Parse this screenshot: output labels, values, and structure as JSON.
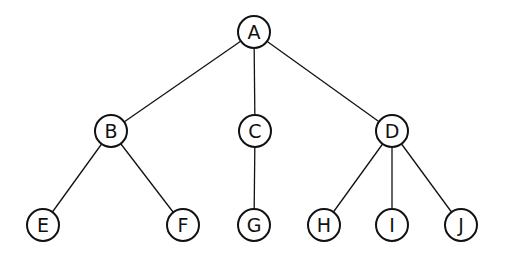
{
  "diagram": {
    "type": "tree",
    "colors": {
      "stroke": "#111111",
      "background": "#ffffff"
    },
    "nodes": [
      {
        "id": "A",
        "label": "A",
        "x": 254,
        "y": 32
      },
      {
        "id": "B",
        "label": "B",
        "x": 111,
        "y": 131
      },
      {
        "id": "C",
        "label": "C",
        "x": 255,
        "y": 131
      },
      {
        "id": "D",
        "label": "D",
        "x": 392,
        "y": 131
      },
      {
        "id": "E",
        "label": "E",
        "x": 43,
        "y": 225
      },
      {
        "id": "F",
        "label": "F",
        "x": 183,
        "y": 225
      },
      {
        "id": "G",
        "label": "G",
        "x": 254,
        "y": 225
      },
      {
        "id": "H",
        "label": "H",
        "x": 324,
        "y": 225
      },
      {
        "id": "I",
        "label": "I",
        "x": 392,
        "y": 225
      },
      {
        "id": "J",
        "label": "J",
        "x": 461,
        "y": 225
      }
    ],
    "edges": [
      [
        "A",
        "B"
      ],
      [
        "A",
        "C"
      ],
      [
        "A",
        "D"
      ],
      [
        "B",
        "E"
      ],
      [
        "B",
        "F"
      ],
      [
        "C",
        "G"
      ],
      [
        "D",
        "H"
      ],
      [
        "D",
        "I"
      ],
      [
        "D",
        "J"
      ]
    ]
  }
}
